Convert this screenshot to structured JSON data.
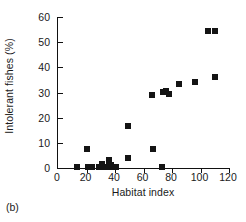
{
  "panel": {
    "tag": "(b)"
  },
  "chart_data": {
    "type": "scatter",
    "title": "",
    "subtitle": "",
    "xlabel": "Habitat index",
    "ylabel": "Intolerant fishes (%)",
    "xlim": [
      0,
      120
    ],
    "ylim": [
      0,
      60
    ],
    "xticks": [
      0,
      20,
      40,
      60,
      80,
      100,
      120
    ],
    "yticks": [
      0,
      10,
      20,
      30,
      40,
      50,
      60
    ],
    "grid": false,
    "legend": null,
    "legend_position": "none",
    "marker": "filled-square",
    "marker_color": "#141414",
    "annotations": [],
    "points": [
      {
        "x": 13,
        "y": 0.3
      },
      {
        "x": 20,
        "y": 7.5
      },
      {
        "x": 21,
        "y": 0.3
      },
      {
        "x": 23,
        "y": 0.4
      },
      {
        "x": 24,
        "y": 0.4
      },
      {
        "x": 29,
        "y": 0.5
      },
      {
        "x": 30,
        "y": 0.5
      },
      {
        "x": 31,
        "y": 1.6
      },
      {
        "x": 34,
        "y": 0.5
      },
      {
        "x": 36,
        "y": 3.0
      },
      {
        "x": 36,
        "y": 1.8
      },
      {
        "x": 37,
        "y": 1.2
      },
      {
        "x": 38,
        "y": 0.5
      },
      {
        "x": 39,
        "y": 0.4
      },
      {
        "x": 40,
        "y": 0.4
      },
      {
        "x": 41,
        "y": 0.4
      },
      {
        "x": 49,
        "y": 3.8
      },
      {
        "x": 49,
        "y": 16.8
      },
      {
        "x": 66,
        "y": 29.0
      },
      {
        "x": 67,
        "y": 7.5
      },
      {
        "x": 73,
        "y": 0.5
      },
      {
        "x": 74,
        "y": 30.3
      },
      {
        "x": 76,
        "y": 30.5
      },
      {
        "x": 78,
        "y": 29.3
      },
      {
        "x": 85,
        "y": 33.3
      },
      {
        "x": 96,
        "y": 34.0
      },
      {
        "x": 105,
        "y": 54.5
      },
      {
        "x": 110,
        "y": 54.5
      },
      {
        "x": 110,
        "y": 36.2
      }
    ]
  }
}
